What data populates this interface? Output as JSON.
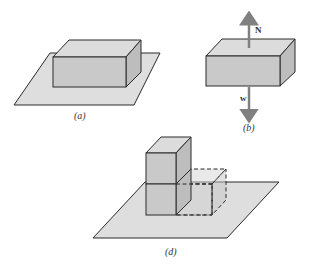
{
  "figure": {
    "panels": [
      {
        "id": "a",
        "label": "(a)",
        "description": "rectangular block resting on a plane"
      },
      {
        "id": "b",
        "label": "(b)",
        "description": "free-body diagram of block with forces",
        "forces": [
          {
            "name": "normal-force",
            "label": "N",
            "direction": "up"
          },
          {
            "name": "weight",
            "label": "w",
            "direction": "down"
          }
        ]
      },
      {
        "id": "d",
        "label": "(d)",
        "description": "two stacked cubes on a plane with a dashed cube outline beside the lower cube"
      }
    ],
    "colors": {
      "face_front": "#c9c9c9",
      "face_top": "#dcdcdc",
      "face_side": "#bdbdbd",
      "plane": "#dedede",
      "stroke": "#2a2a2a",
      "arrow": "#808080"
    }
  }
}
